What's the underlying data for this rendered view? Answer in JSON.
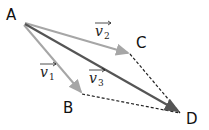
{
  "diagram": {
    "type": "vector-addition",
    "points": [
      {
        "name": "A",
        "label": "A",
        "x": 22,
        "y": 22
      },
      {
        "name": "B",
        "label": "B",
        "x": 82,
        "y": 94
      },
      {
        "name": "C",
        "label": "C",
        "x": 130,
        "y": 54
      },
      {
        "name": "D",
        "label": "D",
        "x": 180,
        "y": 113
      }
    ],
    "vectors": [
      {
        "name": "v1",
        "base": "v",
        "sub": "1",
        "from": "A",
        "to": "B",
        "color": "#a6a6a6"
      },
      {
        "name": "v2",
        "base": "v",
        "sub": "2",
        "from": "A",
        "to": "C",
        "color": "#a6a6a6"
      },
      {
        "name": "v3",
        "base": "v",
        "sub": "3",
        "from": "A",
        "to": "D",
        "color": "#555555"
      }
    ],
    "dashed": [
      {
        "from": "C",
        "to": "D"
      },
      {
        "from": "B",
        "to": "D"
      }
    ]
  }
}
